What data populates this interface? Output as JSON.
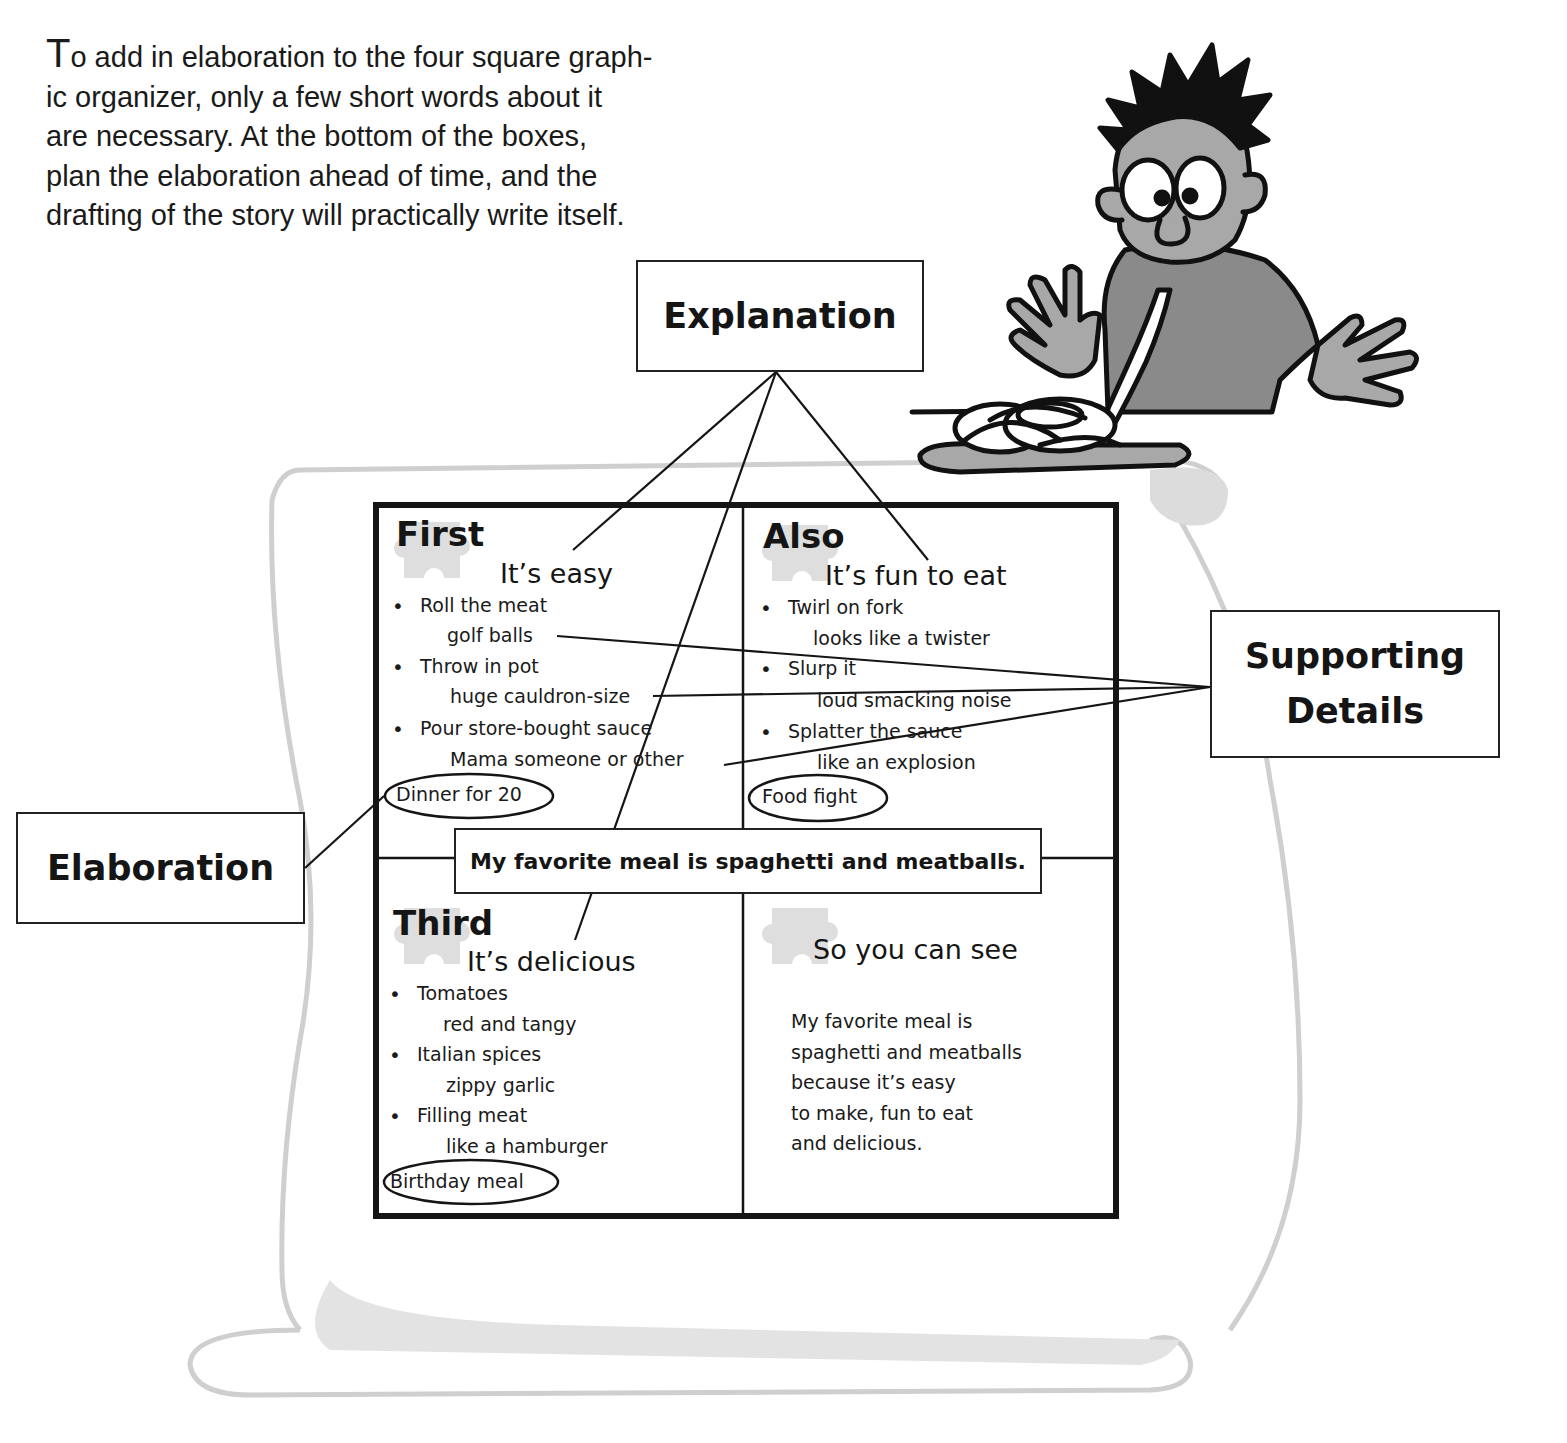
{
  "intro": {
    "lines": [
      "To add in elaboration to the four square graph-",
      "ic organizer, only a few short words about it",
      "are necessary.  At the bottom of the boxes,",
      "plan the elaboration ahead of time, and the",
      "drafting of the story will practically write itself."
    ]
  },
  "callouts": {
    "explanation": "Explanation",
    "supporting_line1": "Supporting",
    "supporting_line2": "Details",
    "elaboration": "Elaboration"
  },
  "organizer": {
    "main_idea": "My favorite meal is spaghetti and meatballs.",
    "first": {
      "heading": "First",
      "topic": "It’s easy",
      "items": [
        {
          "point": "Roll the meat",
          "detail": "golf balls"
        },
        {
          "point": "Throw in pot",
          "detail": "huge cauldron-size"
        },
        {
          "point": "Pour store-bought sauce",
          "detail": "Mama someone or other"
        }
      ],
      "elaboration": "Dinner for 20"
    },
    "also": {
      "heading": "Also",
      "topic": "It’s fun to eat",
      "items": [
        {
          "point": "Twirl on fork",
          "detail": "looks like a twister"
        },
        {
          "point": "Slurp it",
          "detail": "loud smacking noise"
        },
        {
          "point": "Splatter the sauce",
          "detail": "like an explosion"
        }
      ],
      "elaboration": "Food fight"
    },
    "third": {
      "heading": "Third",
      "topic": "It’s delicious",
      "items": [
        {
          "point": "Tomatoes",
          "detail": "red and tangy"
        },
        {
          "point": "Italian spices",
          "detail": "zippy garlic"
        },
        {
          "point": "Filling meat",
          "detail": "like a hamburger"
        }
      ],
      "elaboration": "Birthday meal"
    },
    "conclusion": {
      "heading": "So you can see",
      "summary_lines": [
        "My favorite meal is",
        "spaghetti and meatballs",
        "because it’s easy",
        "to make, fun to eat",
        "and delicious."
      ]
    }
  },
  "illustration": {
    "subject": "cartoon boy slurping spaghetti from a plate"
  },
  "colors": {
    "ink": "#151515",
    "scroll_outline": "#cfcfcf",
    "scroll_shadow": "#d9d9d9",
    "puzzle_piece": "#dedede",
    "skin": "#a8a8a8",
    "shirt": "#8a8a8a"
  }
}
